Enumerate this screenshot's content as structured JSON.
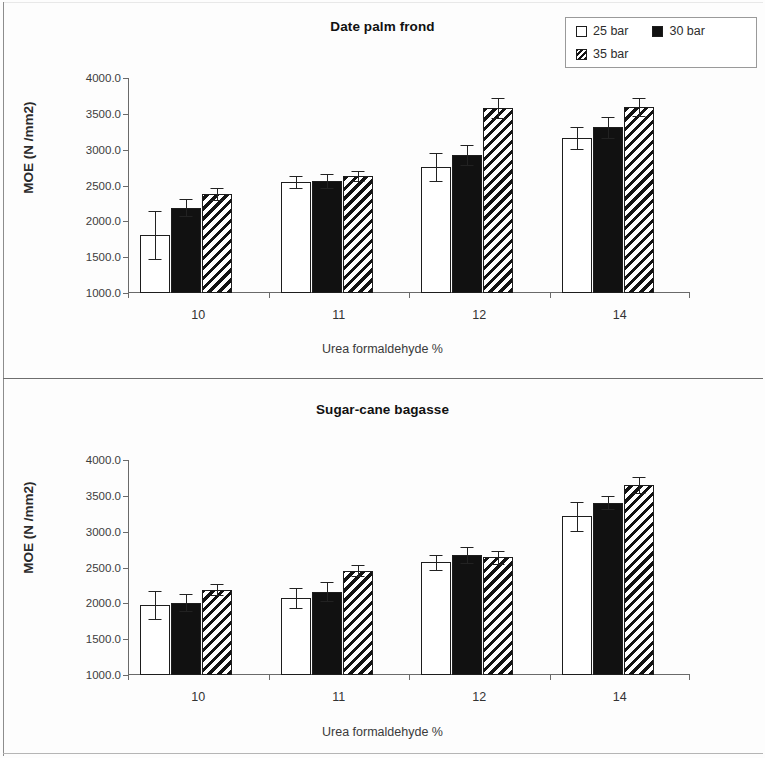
{
  "figure": {
    "legend": {
      "entries": [
        {
          "label": "25 bar",
          "swatch": "open-square-icon",
          "key": "s25",
          "fill": "#ffffff"
        },
        {
          "label": "30 bar",
          "swatch": "filled-square-icon",
          "key": "s30",
          "fill": "#111111"
        },
        {
          "label": "35 bar",
          "swatch": "hatched-square-icon",
          "key": "s35",
          "fill": "#ffffff"
        }
      ]
    }
  },
  "chart_data": [
    {
      "type": "bar",
      "title": "Date palm frond",
      "xlabel": "Urea formaldehyde %",
      "ylabel": "MOE  (N /mm2)",
      "categories": [
        "10",
        "11",
        "12",
        "14"
      ],
      "ylim": [
        1000,
        4000
      ],
      "yticks": [
        1000,
        1500,
        2000,
        2500,
        3000,
        3500,
        4000
      ],
      "ytick_labels": [
        "1000.0",
        "1500.0",
        "2000.0",
        "2500.0",
        "3000.0",
        "3500.0",
        "4000.0"
      ],
      "grid": false,
      "legend_position": "top-right",
      "series": [
        {
          "name": "25 bar",
          "key": "s25",
          "values": [
            1810,
            2545,
            2760,
            3160
          ],
          "errors": [
            330,
            85,
            195,
            150
          ]
        },
        {
          "name": "30 bar",
          "key": "s30",
          "values": [
            2190,
            2565,
            2920,
            3310
          ],
          "errors": [
            115,
            95,
            140,
            150
          ]
        },
        {
          "name": "35 bar",
          "key": "s35",
          "values": [
            2380,
            2630,
            3580,
            3590
          ],
          "errors": [
            85,
            70,
            135,
            125
          ]
        }
      ]
    },
    {
      "type": "bar",
      "title": "Sugar-cane bagasse",
      "xlabel": "Urea formaldehyde %",
      "ylabel": "MOE  (N /mm2)",
      "categories": [
        "10",
        "11",
        "12",
        "14"
      ],
      "ylim": [
        1000,
        4000
      ],
      "yticks": [
        1000,
        1500,
        2000,
        2500,
        3000,
        3500,
        4000
      ],
      "ytick_labels": [
        "1000.0",
        "1500.0",
        "2000.0",
        "2500.0",
        "3000.0",
        "3500.0",
        "4000.0"
      ],
      "grid": false,
      "legend_position": "none",
      "series": [
        {
          "name": "25 bar",
          "key": "s25",
          "values": [
            1975,
            2080,
            2570,
            3215
          ],
          "errors": [
            195,
            140,
            100,
            200
          ]
        },
        {
          "name": "30 bar",
          "key": "s30",
          "values": [
            2010,
            2165,
            2670,
            3405
          ],
          "errors": [
            115,
            135,
            110,
            90
          ]
        },
        {
          "name": "35 bar",
          "key": "s35",
          "values": [
            2190,
            2455,
            2640,
            3650
          ],
          "errors": [
            80,
            80,
            85,
            110
          ]
        }
      ]
    }
  ]
}
